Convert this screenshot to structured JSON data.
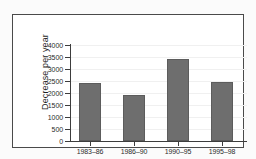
{
  "chart_data": {
    "type": "bar",
    "title": "",
    "subtitle": "",
    "xlabel": "",
    "ylabel": "Decrease per year",
    "categories": [
      "1983–86",
      "1986–90",
      "1990–95",
      "1995–98"
    ],
    "values": [
      2400,
      1900,
      3400,
      2450
    ],
    "series": [
      {
        "name": "Decrease per year",
        "values": [
          2400,
          1900,
          3400,
          2450
        ]
      }
    ],
    "ylim": [
      0,
      4000
    ],
    "ytick_labels": [
      "0",
      "500",
      "1000",
      "1500",
      "2000",
      "2500",
      "3000",
      "3500",
      "4000"
    ],
    "ytick_values": [
      0,
      500,
      1000,
      1500,
      2000,
      2500,
      3000,
      3500,
      4000
    ],
    "grid": true,
    "grid_axis": "y",
    "legend": false,
    "legend_position": "none",
    "annotations": [],
    "colors": {
      "bar_fill": "#6e6e6e",
      "bar_edge": "#5c5c5c",
      "axis": "#3d3d3d",
      "grid": "#f0f0f0",
      "text": "#2b2b2b",
      "frame_border": "#4a4a4a",
      "figure_background": "#fbfbfb",
      "plot_background": "#ffffff"
    }
  }
}
